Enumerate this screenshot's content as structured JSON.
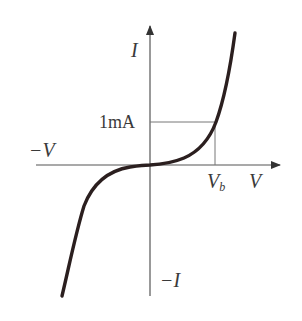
{
  "diagram": {
    "labels": {
      "y_axis_positive": "I",
      "y_axis_negative": "−I",
      "x_axis_positive": "V",
      "x_axis_negative": "−V",
      "current_marker": "1mA",
      "voltage_marker_base": "V",
      "voltage_marker_sub": "b"
    },
    "colors": {
      "axis": "#555555",
      "curve": "#2b1f1f",
      "guide": "#777777",
      "text": "#3a3a3a"
    }
  }
}
